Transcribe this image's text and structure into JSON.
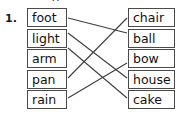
{
  "question": {
    "number": "1."
  },
  "top_partial_glyph": "g",
  "exercise": {
    "type": "matching-compound-words",
    "left_column": {
      "name": "first-word-parts",
      "items": [
        {
          "id": "foot",
          "label": "foot"
        },
        {
          "id": "light",
          "label": "light"
        },
        {
          "id": "arm",
          "label": "arm"
        },
        {
          "id": "pan",
          "label": "pan"
        },
        {
          "id": "rain",
          "label": "rain"
        }
      ]
    },
    "right_column": {
      "name": "second-word-parts",
      "items": [
        {
          "id": "chair",
          "label": "chair"
        },
        {
          "id": "ball",
          "label": "ball"
        },
        {
          "id": "bow",
          "label": "bow"
        },
        {
          "id": "house",
          "label": "house"
        },
        {
          "id": "cake",
          "label": "cake"
        }
      ]
    },
    "connections": [
      {
        "from": "foot",
        "to": "ball"
      },
      {
        "from": "light",
        "to": "house"
      },
      {
        "from": "arm",
        "to": "cake"
      },
      {
        "from": "pan",
        "to": "chair"
      },
      {
        "from": "rain",
        "to": "bow"
      }
    ]
  },
  "style": {
    "line_color": "#3d3d3d",
    "box_border_color": "#4a4a4a",
    "text_color": "#111111",
    "background": "#ffffff"
  }
}
